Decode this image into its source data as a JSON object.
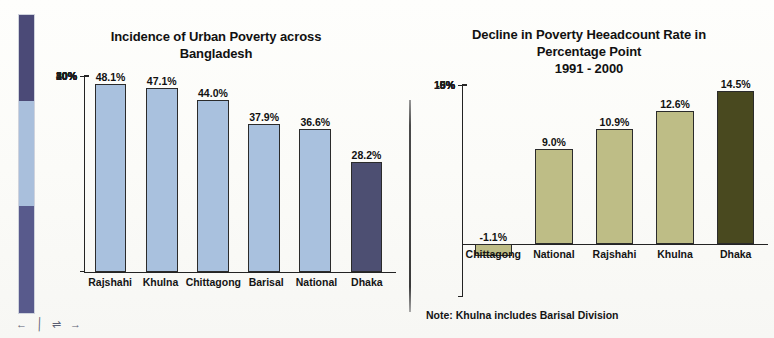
{
  "legend_strip": {
    "name": "vertical-color-key",
    "segments": [
      {
        "label": "dark-slate-top",
        "color": "#4b4a77",
        "height_pct": 29
      },
      {
        "label": "light-blue-middle",
        "color": "#a9bfdc",
        "height_pct": 35
      },
      {
        "label": "dark-slate-bottom",
        "color": "#585a8c",
        "height_pct": 36
      }
    ],
    "markers": [
      "←",
      "╱",
      "⇌",
      "→"
    ]
  },
  "colors": {
    "bar_light_blue": "#a9c1de",
    "bar_dark_navy": "#4d4f72",
    "bar_olive": "#bebd86",
    "bar_dark_olive": "#49491f",
    "axis": "#232323",
    "text": "#141414",
    "background": "#fdfdfb"
  },
  "chart_data": [
    {
      "id": "urban-poverty",
      "type": "bar",
      "title": "Incidence of Urban Poverty across Bangladesh",
      "title_lines": [
        "Incidence of Urban Poverty across",
        "Bangladesh"
      ],
      "xlabel": "",
      "ylabel": "",
      "ylim": [
        0,
        50
      ],
      "yticks": [
        0,
        10,
        20,
        30,
        40,
        50
      ],
      "ytick_labels": [
        "0%",
        "10%",
        "20%",
        "30%",
        "40%",
        "50%"
      ],
      "grid": false,
      "legend": "none",
      "categories": [
        "Rajshahi",
        "Khulna",
        "Chittagong",
        "Barisal",
        "National",
        "Dhaka"
      ],
      "values": [
        48.1,
        47.1,
        44.0,
        37.9,
        36.6,
        28.2
      ],
      "value_labels": [
        "48.1%",
        "47.1%",
        "44.0%",
        "37.9%",
        "36.6%",
        "28.2%"
      ],
      "bar_colors": [
        "#a9c1de",
        "#a9c1de",
        "#a9c1de",
        "#a9c1de",
        "#a9c1de",
        "#4d4f72"
      ]
    },
    {
      "id": "poverty-headcount-decline",
      "type": "bar",
      "title": "Decline in Poverty Heeadcount Rate in Percentage Point 1991 - 2000",
      "title_lines": [
        "Decline in Poverty Heeadcount Rate in",
        "Percentage Point",
        "1991 - 2000"
      ],
      "xlabel": "",
      "ylabel": "",
      "ylim": [
        -5,
        15
      ],
      "yticks": [
        -5,
        0,
        5,
        10,
        15
      ],
      "ytick_labels": [
        "-5%",
        "0%",
        "5%",
        "10%",
        "15%"
      ],
      "grid": false,
      "legend": "none",
      "note": "Note: Khulna includes Barisal Division",
      "categories": [
        "Chittagong",
        "National",
        "Rajshahi",
        "Khulna",
        "Dhaka"
      ],
      "values": [
        -1.1,
        9.0,
        10.9,
        12.6,
        14.5
      ],
      "value_labels": [
        "-1.1%",
        "9.0%",
        "10.9%",
        "12.6%",
        "14.5%"
      ],
      "bar_colors": [
        "#bebd86",
        "#bebd86",
        "#bebd86",
        "#bebd86",
        "#49491f"
      ]
    }
  ]
}
